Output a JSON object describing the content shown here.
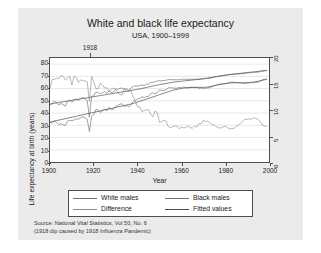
{
  "figure": {
    "title": "White and black life expectancy",
    "subtitle": "USA, 1900–1999",
    "annotation_1918": "1918",
    "notes": [
      "Source: National Vital Statistics, Vol 50, No. 6",
      "(1918 dip caused by 1918 Influenza Pandemic)"
    ]
  },
  "legend": {
    "items": [
      {
        "label": "White males",
        "color": "#707070"
      },
      {
        "label": "Black males",
        "color": "#707070"
      },
      {
        "label": "Difference",
        "color": "#909090"
      },
      {
        "label": "Fitted values",
        "color": "#4d4d4d"
      }
    ]
  },
  "axes": {
    "y_title": "Life expectancy at birth (years)",
    "y_ticks": [
      "0",
      "10",
      "20",
      "30",
      "40",
      "50",
      "60",
      "70",
      "80"
    ],
    "x_title": "Year",
    "x_ticks": [
      "1900",
      "1920",
      "1940",
      "1960",
      "1980",
      "2000"
    ],
    "right_ticks": [
      "0",
      "5",
      "10",
      "15",
      "20"
    ]
  },
  "chart_data": {
    "type": "line",
    "title": "White and black life expectancy",
    "subtitle": "USA, 1900–1999",
    "xlabel": "Year",
    "ylabel": "Life expectancy at birth (years)",
    "xlim": [
      1900,
      2000
    ],
    "ylim": [
      0,
      85
    ],
    "right_ylim": [
      0,
      20
    ],
    "right_ylabel": "Difference (years)",
    "grid": "horizontal",
    "legend_position": "bottom",
    "annotations": [
      {
        "text": "1918",
        "x": 1918,
        "note": "1918 dip caused by 1918 Influenza Pandemic"
      }
    ],
    "x": [
      1900,
      1901,
      1902,
      1903,
      1904,
      1905,
      1906,
      1907,
      1908,
      1909,
      1910,
      1911,
      1912,
      1913,
      1914,
      1915,
      1916,
      1917,
      1918,
      1919,
      1920,
      1921,
      1922,
      1923,
      1924,
      1925,
      1926,
      1927,
      1928,
      1929,
      1930,
      1931,
      1932,
      1933,
      1934,
      1935,
      1936,
      1937,
      1938,
      1939,
      1940,
      1941,
      1942,
      1943,
      1944,
      1945,
      1946,
      1947,
      1948,
      1949,
      1950,
      1951,
      1952,
      1953,
      1954,
      1955,
      1956,
      1957,
      1958,
      1959,
      1960,
      1961,
      1962,
      1963,
      1964,
      1965,
      1966,
      1967,
      1968,
      1969,
      1970,
      1971,
      1972,
      1973,
      1974,
      1975,
      1976,
      1977,
      1978,
      1979,
      1980,
      1981,
      1982,
      1983,
      1984,
      1985,
      1986,
      1987,
      1988,
      1989,
      1990,
      1991,
      1992,
      1993,
      1994,
      1995,
      1996,
      1997,
      1998,
      1999
    ],
    "series": [
      {
        "name": "White males",
        "color": "#707070",
        "axis": "left",
        "values": [
          46.6,
          47.6,
          49.8,
          48.5,
          46.6,
          47.9,
          46.9,
          45.6,
          49.5,
          50.5,
          48.6,
          50.9,
          51.5,
          50.3,
          52.0,
          52.5,
          51.7,
          50.2,
          36.6,
          53.5,
          54.4,
          57.2,
          56.7,
          55.7,
          56.8,
          57.6,
          56.1,
          58.3,
          56.8,
          57.2,
          59.7,
          59.4,
          60.3,
          60.4,
          59.3,
          59.9,
          58.5,
          60.6,
          61.9,
          62.1,
          62.1,
          62.4,
          63.1,
          62.4,
          63.6,
          63.6,
          65.1,
          65.2,
          65.5,
          66.2,
          66.5,
          66.3,
          66.6,
          66.8,
          67.4,
          67.3,
          67.3,
          67.2,
          67.2,
          67.3,
          67.4,
          67.8,
          67.6,
          67.5,
          67.7,
          67.6,
          67.6,
          67.8,
          67.5,
          67.8,
          68.0,
          68.3,
          68.3,
          68.4,
          68.9,
          69.5,
          69.7,
          70.0,
          70.2,
          70.6,
          70.7,
          71.1,
          71.5,
          71.6,
          71.8,
          71.8,
          71.9,
          72.1,
          72.2,
          72.5,
          72.7,
          72.9,
          73.2,
          73.1,
          73.3,
          73.4,
          73.8,
          74.3,
          74.5,
          74.6
        ]
      },
      {
        "name": "Black males",
        "color": "#707070",
        "axis": "left",
        "values": [
          32.5,
          31.7,
          33.9,
          32.4,
          30.6,
          31.3,
          30.4,
          29.8,
          33.4,
          34.0,
          33.8,
          34.4,
          35.3,
          35.0,
          36.2,
          36.9,
          36.1,
          34.8,
          24.9,
          37.1,
          39.0,
          43.1,
          42.6,
          40.5,
          42.0,
          43.4,
          41.8,
          44.7,
          42.7,
          43.0,
          45.7,
          46.1,
          47.3,
          47.5,
          45.1,
          46.3,
          44.9,
          46.9,
          49.4,
          50.4,
          51.5,
          51.8,
          53.4,
          52.5,
          53.6,
          53.5,
          56.0,
          56.5,
          55.7,
          56.7,
          58.9,
          58.5,
          58.6,
          58.9,
          60.6,
          60.7,
          60.5,
          60.3,
          60.3,
          60.9,
          60.7,
          61.2,
          61.0,
          60.5,
          61.1,
          61.1,
          60.7,
          61.1,
          60.1,
          60.5,
          60.0,
          60.5,
          60.4,
          60.9,
          61.7,
          62.4,
          62.9,
          63.4,
          63.7,
          63.9,
          63.8,
          64.5,
          65.1,
          65.2,
          65.3,
          65.0,
          64.8,
          64.7,
          64.4,
          64.3,
          64.5,
          64.6,
          65.0,
          64.6,
          64.9,
          65.2,
          66.1,
          67.2,
          67.6,
          67.8
        ]
      },
      {
        "name": "Difference",
        "color": "#909090",
        "axis": "right",
        "values": [
          14.1,
          15.9,
          15.9,
          16.1,
          16.0,
          16.6,
          16.5,
          15.8,
          16.1,
          16.5,
          14.8,
          16.5,
          16.2,
          15.3,
          15.8,
          15.6,
          15.6,
          15.4,
          11.7,
          16.4,
          15.4,
          14.1,
          14.1,
          15.2,
          14.8,
          14.2,
          14.3,
          13.6,
          14.1,
          14.2,
          14.0,
          13.3,
          13.0,
          12.9,
          14.2,
          13.6,
          13.6,
          13.7,
          12.5,
          11.7,
          10.6,
          10.6,
          9.7,
          9.9,
          10.0,
          10.1,
          9.1,
          8.7,
          9.8,
          9.5,
          7.6,
          7.8,
          8.0,
          7.9,
          6.8,
          6.6,
          6.8,
          6.9,
          6.9,
          6.4,
          6.7,
          6.6,
          6.6,
          7.0,
          6.6,
          6.5,
          6.9,
          6.7,
          7.4,
          7.3,
          8.0,
          7.8,
          7.9,
          7.5,
          7.2,
          7.1,
          6.8,
          6.6,
          6.5,
          6.7,
          6.9,
          6.6,
          6.4,
          6.4,
          6.5,
          6.8,
          7.1,
          7.4,
          7.8,
          8.2,
          8.2,
          8.3,
          8.2,
          8.5,
          8.4,
          8.2,
          7.7,
          7.1,
          6.9,
          6.8
        ]
      },
      {
        "name": "Fitted values (white males)",
        "color": "#4d4d4d",
        "axis": "left",
        "values": [
          47.4,
          47.7,
          48.0,
          48.3,
          48.6,
          48.9,
          49.2,
          49.5,
          49.8,
          50.1,
          50.4,
          50.7,
          51.0,
          51.3,
          51.6,
          51.9,
          52.2,
          52.5,
          52.8,
          53.1,
          53.4,
          53.7,
          54.0,
          54.3,
          54.6,
          54.9,
          55.2,
          55.5,
          55.8,
          56.1,
          56.4,
          56.7,
          57.0,
          57.3,
          57.6,
          57.9,
          58.2,
          58.5,
          58.8,
          59.1,
          59.4,
          59.7,
          60.1,
          60.5,
          60.9,
          61.3,
          61.7,
          62.1,
          62.5,
          62.9,
          63.3,
          63.6,
          63.9,
          64.2,
          64.5,
          64.8,
          65.1,
          65.4,
          65.6,
          65.8,
          66.0,
          66.2,
          66.4,
          66.6,
          66.8,
          67.0,
          67.2,
          67.4,
          67.6,
          67.8,
          68.0,
          68.3,
          68.6,
          68.9,
          69.2,
          69.5,
          69.8,
          70.1,
          70.4,
          70.7,
          71.0,
          71.3,
          71.5,
          71.7,
          71.9,
          72.1,
          72.3,
          72.5,
          72.7,
          72.9,
          73.1,
          73.3,
          73.5,
          73.7,
          73.9,
          74.1,
          74.3,
          74.5,
          74.7,
          74.9
        ]
      },
      {
        "name": "Fitted values (black males)",
        "color": "#4d4d4d",
        "axis": "left",
        "values": [
          32.6,
          33.0,
          33.4,
          33.8,
          34.2,
          34.6,
          35.0,
          35.4,
          35.8,
          36.2,
          36.6,
          37.0,
          37.4,
          37.8,
          38.2,
          38.6,
          39.0,
          39.4,
          39.8,
          40.2,
          40.6,
          41.0,
          41.4,
          41.8,
          42.2,
          42.6,
          43.0,
          43.4,
          43.8,
          44.2,
          44.6,
          45.0,
          45.4,
          45.8,
          46.2,
          46.6,
          47.0,
          47.4,
          47.8,
          48.4,
          49.0,
          49.6,
          50.2,
          50.8,
          51.4,
          52.0,
          52.6,
          53.2,
          53.8,
          54.4,
          55.0,
          55.6,
          56.2,
          56.8,
          57.4,
          58.0,
          58.5,
          59.0,
          59.4,
          59.8,
          60.1,
          60.4,
          60.6,
          60.7,
          60.8,
          60.9,
          61.0,
          61.0,
          61.0,
          61.0,
          61.0,
          61.1,
          61.3,
          61.6,
          62.0,
          62.4,
          62.8,
          63.2,
          63.5,
          63.8,
          64.1,
          64.3,
          64.5,
          64.6,
          64.7,
          64.8,
          64.8,
          64.8,
          64.8,
          64.8,
          64.9,
          65.0,
          65.2,
          65.4,
          65.7,
          66.0,
          66.4,
          66.8,
          67.2,
          67.6
        ]
      }
    ]
  }
}
